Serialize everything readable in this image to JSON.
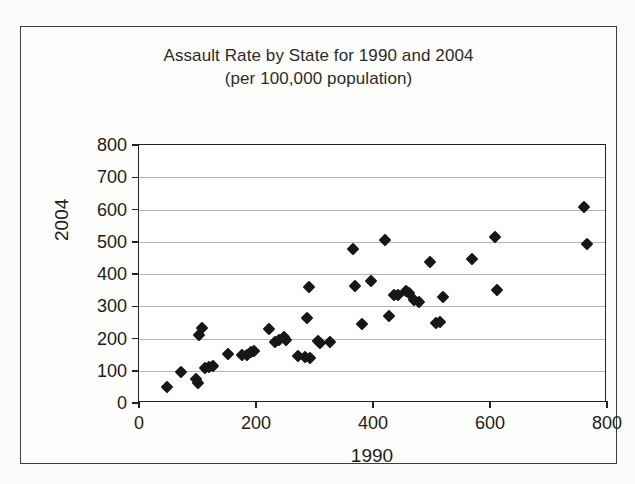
{
  "chart_data": {
    "type": "scatter",
    "title": "Assault Rate by State for 1990 and 2004",
    "subtitle": "(per 100,000 population)",
    "xlabel": "1990",
    "ylabel": "2004",
    "xlim": [
      0,
      800
    ],
    "ylim": [
      0,
      800
    ],
    "xticks": [
      0,
      200,
      400,
      600,
      800
    ],
    "xtick_labels": [
      "0",
      "200",
      "400",
      "600",
      "800"
    ],
    "yticks": [
      0,
      100,
      200,
      300,
      400,
      500,
      600,
      700,
      800
    ],
    "ytick_labels": [
      "0",
      "100",
      "200",
      "300",
      "400",
      "500",
      "600",
      "700",
      "800"
    ],
    "grid": "horizontal",
    "legend": "none",
    "marker": "diamond",
    "marker_color": "#171717",
    "points": [
      {
        "x": 48,
        "y": 50
      },
      {
        "x": 72,
        "y": 96
      },
      {
        "x": 97,
        "y": 74
      },
      {
        "x": 100,
        "y": 62
      },
      {
        "x": 103,
        "y": 212
      },
      {
        "x": 107,
        "y": 232
      },
      {
        "x": 113,
        "y": 108
      },
      {
        "x": 119,
        "y": 113
      },
      {
        "x": 127,
        "y": 116
      },
      {
        "x": 152,
        "y": 151
      },
      {
        "x": 176,
        "y": 148
      },
      {
        "x": 184,
        "y": 148
      },
      {
        "x": 192,
        "y": 157
      },
      {
        "x": 197,
        "y": 162
      },
      {
        "x": 222,
        "y": 228
      },
      {
        "x": 232,
        "y": 190
      },
      {
        "x": 240,
        "y": 196
      },
      {
        "x": 248,
        "y": 206
      },
      {
        "x": 252,
        "y": 196
      },
      {
        "x": 272,
        "y": 145
      },
      {
        "x": 284,
        "y": 143
      },
      {
        "x": 288,
        "y": 265
      },
      {
        "x": 291,
        "y": 360
      },
      {
        "x": 292,
        "y": 138
      },
      {
        "x": 306,
        "y": 193
      },
      {
        "x": 310,
        "y": 185
      },
      {
        "x": 327,
        "y": 189
      },
      {
        "x": 366,
        "y": 478
      },
      {
        "x": 370,
        "y": 364
      },
      {
        "x": 381,
        "y": 246
      },
      {
        "x": 396,
        "y": 379
      },
      {
        "x": 420,
        "y": 505
      },
      {
        "x": 427,
        "y": 270
      },
      {
        "x": 436,
        "y": 334
      },
      {
        "x": 443,
        "y": 336
      },
      {
        "x": 457,
        "y": 348
      },
      {
        "x": 462,
        "y": 340
      },
      {
        "x": 470,
        "y": 320
      },
      {
        "x": 479,
        "y": 313
      },
      {
        "x": 498,
        "y": 437
      },
      {
        "x": 507,
        "y": 248
      },
      {
        "x": 514,
        "y": 250
      },
      {
        "x": 520,
        "y": 328
      },
      {
        "x": 570,
        "y": 447
      },
      {
        "x": 608,
        "y": 514
      },
      {
        "x": 612,
        "y": 349
      },
      {
        "x": 760,
        "y": 607
      },
      {
        "x": 765,
        "y": 494
      }
    ]
  },
  "figure": {
    "frame_color": "#3d3d3d",
    "axis_color": "#222222",
    "grid_color": "#b4b4b4",
    "background": "#ffffff"
  }
}
